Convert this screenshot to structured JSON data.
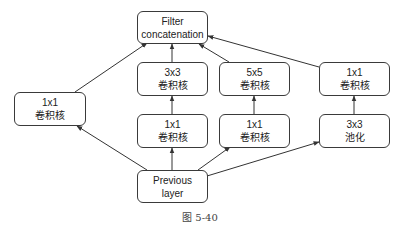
{
  "diagram": {
    "type": "inception-module",
    "nodes": [
      {
        "id": "concat",
        "line1": "Filter",
        "line2": "concatenation",
        "x": 137,
        "y": 11,
        "w": 71,
        "h": 33
      },
      {
        "id": "conv3x3",
        "line1": "3x3",
        "line2": "卷积核",
        "x": 137,
        "y": 62,
        "w": 71,
        "h": 34
      },
      {
        "id": "conv5x5",
        "line1": "5x5",
        "line2": "卷积核",
        "x": 219,
        "y": 62,
        "w": 71,
        "h": 34
      },
      {
        "id": "conv1x1_pool",
        "line1": "1x1",
        "line2": "卷积核",
        "x": 319,
        "y": 62,
        "w": 71,
        "h": 34
      },
      {
        "id": "conv1x1_direct",
        "line1": "1x1",
        "line2": "卷积核",
        "x": 14,
        "y": 92,
        "w": 72,
        "h": 34
      },
      {
        "id": "conv1x1_a",
        "line1": "1x1",
        "line2": "卷积核",
        "x": 137,
        "y": 114,
        "w": 71,
        "h": 34
      },
      {
        "id": "conv1x1_b",
        "line1": "1x1",
        "line2": "卷积核",
        "x": 219,
        "y": 114,
        "w": 71,
        "h": 34
      },
      {
        "id": "pool3x3",
        "line1": "3x3",
        "line2": "池化",
        "x": 319,
        "y": 114,
        "w": 71,
        "h": 34
      },
      {
        "id": "prev",
        "line1": "Previous",
        "line2": "layer",
        "x": 137,
        "y": 170,
        "w": 71,
        "h": 33
      }
    ],
    "edges": [
      {
        "from": "prev",
        "to": "conv1x1_direct",
        "x1": 147,
        "y1": 170,
        "x2": 77,
        "y2": 126
      },
      {
        "from": "prev",
        "to": "conv1x1_a",
        "x1": 172,
        "y1": 170,
        "x2": 172,
        "y2": 148
      },
      {
        "from": "prev",
        "to": "conv1x1_b",
        "x1": 198,
        "y1": 170,
        "x2": 230,
        "y2": 147
      },
      {
        "from": "prev",
        "to": "pool3x3",
        "x1": 207,
        "y1": 176,
        "x2": 319,
        "y2": 142
      },
      {
        "from": "conv1x1_a",
        "to": "conv3x3",
        "x1": 172,
        "y1": 114,
        "x2": 172,
        "y2": 96
      },
      {
        "from": "conv1x1_b",
        "to": "conv5x5",
        "x1": 254,
        "y1": 114,
        "x2": 254,
        "y2": 96
      },
      {
        "from": "pool3x3",
        "to": "conv1x1_pool",
        "x1": 354,
        "y1": 114,
        "x2": 354,
        "y2": 96
      },
      {
        "from": "conv1x1_direct",
        "to": "concat",
        "x1": 75,
        "y1": 92,
        "x2": 147,
        "y2": 43
      },
      {
        "from": "conv3x3",
        "to": "concat",
        "x1": 172,
        "y1": 62,
        "x2": 172,
        "y2": 44
      },
      {
        "from": "conv5x5",
        "to": "concat",
        "x1": 229,
        "y1": 62,
        "x2": 199,
        "y2": 44
      },
      {
        "from": "conv1x1_pool",
        "to": "concat",
        "x1": 319,
        "y1": 67,
        "x2": 208,
        "y2": 36
      }
    ],
    "stroke_color": "#333333"
  },
  "caption": "图 5-40"
}
